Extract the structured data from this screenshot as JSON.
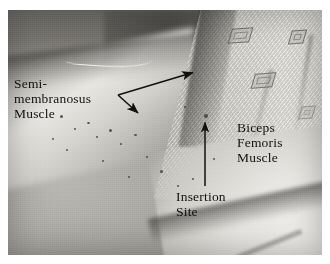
{
  "figure": {
    "kind": "anatomy-photograph",
    "media": "grayscale photograph",
    "border_color": "#ffffff",
    "ink_color": "#111111"
  },
  "labels": {
    "semimembranosus": "Semi-\nmembranosus\nMuscle",
    "biceps_femoris": "Biceps\nFemoris\nMuscle",
    "insertion_site": "Insertion\nSite"
  },
  "annotations": [
    {
      "name": "semimembranosus-pointer",
      "label_ref": "semimembranosus",
      "style": "double-headed-v",
      "vertex": [
        118,
        95
      ],
      "tips": [
        [
          196,
          72
        ],
        [
          140,
          116
        ]
      ],
      "color": "#111111"
    },
    {
      "name": "insertion-site-pointer",
      "label_ref": "insertion_site",
      "style": "single-arrow-up",
      "tail": [
        205,
        186
      ],
      "tip": [
        205,
        119
      ],
      "color": "#111111"
    }
  ],
  "photo_regions": [
    {
      "name": "upper-thigh-shadow",
      "tone": "dark-gray"
    },
    {
      "name": "skin-highlight-band",
      "tone": "bright"
    },
    {
      "name": "patterned-gown",
      "tone": "light-gray",
      "motif": "diamond"
    },
    {
      "name": "surgical-sheet",
      "tone": "white"
    }
  ],
  "colors": {
    "paper": "#ffffff",
    "skin_mid": "#a8a6a1",
    "shadow": "#5d5b57",
    "drape": "#e6e4df",
    "ink": "#111111"
  }
}
